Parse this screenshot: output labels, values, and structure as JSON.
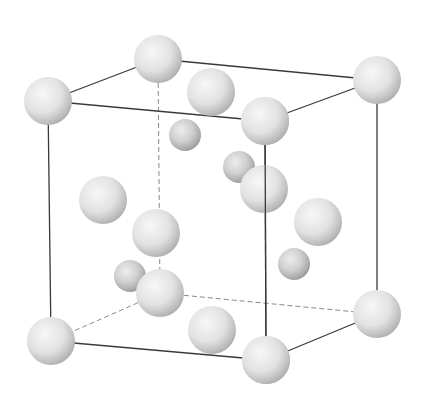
{
  "figure": {
    "colors": {
      "background": "#ffffff",
      "edge": "#3a3a3a",
      "hidden_edge": "#8a8a8a",
      "atom_light": "#f4f4f4",
      "atom_mid": "#d6d6d6",
      "atom_dark": "#9a9a9a"
    },
    "cube_vertices": {
      "top_back_left": [
        158,
        59
      ],
      "top_front_left": [
        48,
        101
      ],
      "top_back_right": [
        377,
        80
      ],
      "top_front_right": [
        265,
        121
      ],
      "bottom_back_left": [
        160,
        293
      ],
      "bottom_front_left": [
        51,
        341
      ],
      "bottom_back_right": [
        377,
        314
      ],
      "bottom_front_right": [
        266,
        360
      ]
    },
    "solid_edges": [
      [
        "top_back_left",
        "top_front_left"
      ],
      [
        "top_back_left",
        "top_back_right"
      ],
      [
        "top_front_left",
        "top_front_right"
      ],
      [
        "top_back_right",
        "top_front_right"
      ],
      [
        "top_front_left",
        "bottom_front_left"
      ],
      [
        "top_front_right",
        "bottom_front_right"
      ],
      [
        "top_back_right",
        "bottom_back_right"
      ],
      [
        "bottom_front_left",
        "bottom_front_right"
      ],
      [
        "bottom_front_right",
        "bottom_back_right"
      ]
    ],
    "hidden_edges": [
      [
        "top_back_left",
        "bottom_back_left"
      ],
      [
        "bottom_back_left",
        "bottom_front_left"
      ],
      [
        "bottom_back_left",
        "bottom_back_right"
      ]
    ],
    "large_atoms": [
      {
        "name": "corner-top-back-left",
        "x": 158,
        "y": 59,
        "r": 24
      },
      {
        "name": "corner-top-front-left",
        "x": 48,
        "y": 101,
        "r": 24
      },
      {
        "name": "corner-top-back-right",
        "x": 377,
        "y": 80,
        "r": 24
      },
      {
        "name": "face-top",
        "x": 211,
        "y": 92,
        "r": 24
      },
      {
        "name": "face-left",
        "x": 103,
        "y": 200,
        "r": 24
      },
      {
        "name": "face-back",
        "x": 156,
        "y": 233,
        "r": 24
      },
      {
        "name": "corner-bottom-back-left",
        "x": 160,
        "y": 293,
        "r": 24
      },
      {
        "name": "face-right",
        "x": 318,
        "y": 222,
        "r": 24
      },
      {
        "name": "face-front",
        "x": 264,
        "y": 189,
        "r": 24
      },
      {
        "name": "corner-top-front-right",
        "x": 265,
        "y": 121,
        "r": 24
      },
      {
        "name": "face-bottom",
        "x": 212,
        "y": 330,
        "r": 24
      },
      {
        "name": "corner-bottom-back-right",
        "x": 377,
        "y": 314,
        "r": 24
      },
      {
        "name": "corner-bottom-front-left",
        "x": 51,
        "y": 341,
        "r": 24
      },
      {
        "name": "corner-bottom-front-right",
        "x": 266,
        "y": 360,
        "r": 24
      }
    ],
    "small_atoms": [
      {
        "name": "tetrahedral-1",
        "x": 185,
        "y": 135,
        "r": 16
      },
      {
        "name": "tetrahedral-2",
        "x": 239,
        "y": 167,
        "r": 16
      },
      {
        "name": "tetrahedral-3",
        "x": 130,
        "y": 276,
        "r": 16
      },
      {
        "name": "tetrahedral-4",
        "x": 294,
        "y": 264,
        "r": 16
      }
    ]
  }
}
